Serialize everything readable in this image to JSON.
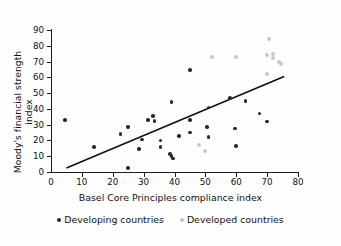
{
  "chart_data": {
    "type": "scatter",
    "title": "",
    "xlabel": "Basel Core Principles compliance index",
    "ylabel": "Moody's financial strength index",
    "xlim": [
      0,
      80
    ],
    "ylim": [
      0,
      90
    ],
    "xticks": [
      0,
      10,
      20,
      30,
      40,
      50,
      60,
      70,
      80
    ],
    "yticks": [
      0,
      10,
      20,
      30,
      40,
      50,
      60,
      70,
      80,
      90
    ],
    "grid": false,
    "legend_position": "bottom",
    "series": [
      {
        "name": "Developing countries",
        "color": "#2a2a2e",
        "points": [
          [
            4.5,
            33
          ],
          [
            14,
            16
          ],
          [
            22.5,
            24
          ],
          [
            25,
            28.5
          ],
          [
            25,
            2.5
          ],
          [
            28.5,
            14.5
          ],
          [
            29.5,
            20.5
          ],
          [
            31.5,
            33
          ],
          [
            33,
            35.5
          ],
          [
            33.5,
            32.5
          ],
          [
            35.5,
            20
          ],
          [
            35.5,
            16
          ],
          [
            38.5,
            11.5
          ],
          [
            39,
            10
          ],
          [
            39.5,
            8.5
          ],
          [
            39,
            44.5
          ],
          [
            41.5,
            23
          ],
          [
            45,
            64.5
          ],
          [
            45,
            33
          ],
          [
            45,
            25
          ],
          [
            50.5,
            28.5
          ],
          [
            51,
            41
          ],
          [
            51,
            22
          ],
          [
            58,
            47
          ],
          [
            59.5,
            27.5
          ],
          [
            60,
            16.5
          ],
          [
            63,
            45
          ],
          [
            67.5,
            37
          ],
          [
            70,
            32
          ]
        ]
      },
      {
        "name": "Developed countries",
        "color": "#c8c8c8",
        "points": [
          [
            48,
            17
          ],
          [
            50,
            13
          ],
          [
            52,
            73
          ],
          [
            60,
            73
          ],
          [
            70.5,
            84
          ],
          [
            70,
            74
          ],
          [
            70,
            62
          ],
          [
            72,
            75
          ],
          [
            72,
            72
          ],
          [
            74,
            69.5
          ],
          [
            74.5,
            68.5
          ]
        ]
      }
    ],
    "trend_line": {
      "x_start": 5,
      "y_start": 2.5,
      "x_end": 75.5,
      "y_end": 60.5,
      "color": "#111111"
    }
  },
  "legend": {
    "items": [
      {
        "label": "Developing countries",
        "marker": "dot-dark"
      },
      {
        "label": "Developed countries",
        "marker": "dot-gray"
      }
    ]
  },
  "axes": {
    "y_tick_labels": [
      "0",
      "10",
      "20",
      "30",
      "40",
      "50",
      "60",
      "70",
      "80",
      "90"
    ],
    "x_tick_labels": [
      "0",
      "10",
      "20",
      "30",
      "40",
      "50",
      "60",
      "70",
      "80"
    ],
    "y_title": "Moody's financial strength index",
    "x_title": "Basel Core Principles compliance index"
  }
}
